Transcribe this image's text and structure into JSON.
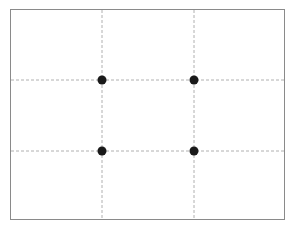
{
  "diagram": {
    "frame": {
      "x": 10,
      "y": 9,
      "width": 275,
      "height": 211,
      "stroke": "#8a8a8a"
    },
    "grid_lines": {
      "vertical_x": [
        102,
        194
      ],
      "horizontal_y": [
        80,
        151
      ],
      "stroke": "#b0b0b0",
      "dash": "3,2"
    },
    "intersection_points": [
      {
        "name": "top-left",
        "x": 102,
        "y": 80
      },
      {
        "name": "top-right",
        "x": 194,
        "y": 80
      },
      {
        "name": "bottom-left",
        "x": 102,
        "y": 151
      },
      {
        "name": "bottom-right",
        "x": 194,
        "y": 151
      }
    ],
    "point_color": "#1a1a1a",
    "point_radius": 4.5
  }
}
